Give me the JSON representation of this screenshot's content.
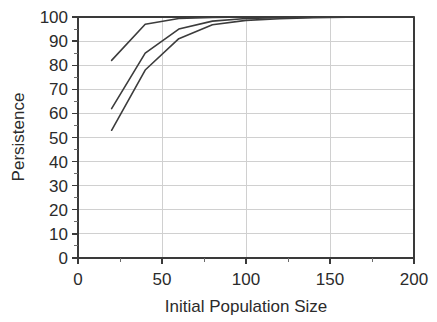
{
  "chart_data": {
    "type": "line",
    "title": "",
    "xlabel": "Initial Population Size",
    "ylabel": "Persistence",
    "xlim": [
      0,
      200
    ],
    "ylim": [
      0,
      100
    ],
    "grid": true,
    "legend": "none",
    "x_ticks": [
      0,
      50,
      100,
      150,
      200
    ],
    "x_tick_labels": [
      "0",
      "50",
      "100",
      "150",
      "200"
    ],
    "x_minor_step": 25,
    "y_ticks": [
      0,
      10,
      20,
      30,
      40,
      50,
      60,
      70,
      80,
      90,
      100
    ],
    "y_tick_labels": [
      "0",
      "10",
      "20",
      "30",
      "40",
      "50",
      "60",
      "70",
      "80",
      "90",
      "100"
    ],
    "y_minor_step": 5,
    "series": [
      {
        "name": "upper-curve",
        "x": [
          20,
          40,
          60,
          80,
          100,
          120,
          140,
          160,
          180,
          200
        ],
        "values": [
          82,
          97,
          99.4,
          99.8,
          100,
          100,
          100,
          100,
          100,
          100
        ]
      },
      {
        "name": "middle-curve",
        "x": [
          20,
          40,
          60,
          80,
          100,
          120,
          140,
          160,
          180,
          200
        ],
        "values": [
          62,
          85,
          95,
          98.3,
          99.4,
          99.7,
          99.9,
          100,
          100,
          100
        ]
      },
      {
        "name": "lower-curve",
        "x": [
          20,
          40,
          60,
          80,
          100,
          120,
          140,
          160,
          180,
          200
        ],
        "values": [
          53,
          78,
          91,
          96.8,
          98.6,
          99.3,
          99.7,
          99.9,
          100,
          100
        ]
      }
    ]
  },
  "plot_colors": {
    "line": "#3c3c3c",
    "grid": "#d0d0d0",
    "axis": "#3a3a3a",
    "text": "#2b2b2b",
    "background": "#ffffff"
  }
}
